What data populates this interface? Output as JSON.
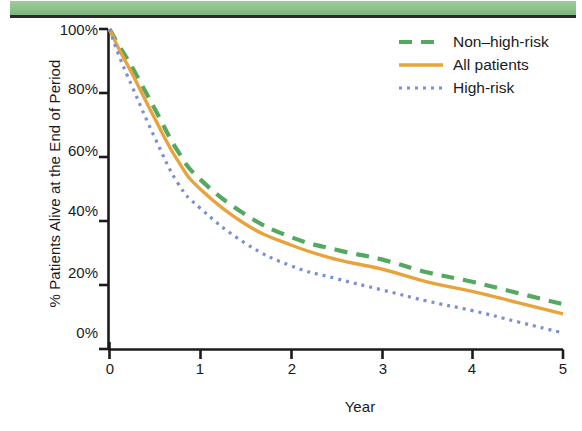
{
  "banner": {
    "name": "top-green-banner",
    "color": "#8cc08a",
    "rule_color": "#2a2a28"
  },
  "chart_data": {
    "type": "line",
    "title": "",
    "subtitle": "",
    "xlabel": "Year",
    "ylabel": "% Patients Alive at the End of Period",
    "xlim": [
      0,
      5
    ],
    "ylim": [
      0,
      100
    ],
    "grid": false,
    "legend_position": "top-right",
    "xticks": [
      0,
      1,
      2,
      3,
      4,
      5
    ],
    "xtick_labels": [
      "0",
      "1",
      "2",
      "3",
      "4",
      "5"
    ],
    "yticks": [
      0,
      20,
      40,
      60,
      80,
      100
    ],
    "ytick_labels": [
      "0%",
      "20%",
      "40%",
      "60%",
      "80%",
      "100%"
    ],
    "x": [
      0,
      0.1,
      0.25,
      0.5,
      0.75,
      1,
      1.5,
      2,
      2.5,
      3,
      3.5,
      4,
      4.5,
      5
    ],
    "series": [
      {
        "name": "Non–high-risk",
        "label": "Non–high-risk",
        "color": "#55a860",
        "style": "dashed",
        "values": [
          100,
          95,
          88,
          75,
          62,
          53,
          42,
          35,
          31,
          28,
          24,
          21,
          17.5,
          14
        ]
      },
      {
        "name": "All patients",
        "label": "All patients",
        "color": "#e9a33c",
        "style": "solid",
        "values": [
          100,
          94,
          86,
          72,
          59,
          50,
          39,
          32.5,
          28,
          25,
          21,
          18,
          14.5,
          11
        ]
      },
      {
        "name": "High-risk",
        "label": "High-risk",
        "color": "#7b8fd4",
        "style": "dotted",
        "values": [
          100,
          92,
          82,
          66,
          52,
          44,
          33,
          26,
          22,
          18.5,
          15,
          12,
          8.5,
          5
        ]
      }
    ]
  },
  "legend": {
    "entries": [
      {
        "label": "Non–high-risk",
        "color": "#55a860",
        "style": "dashed"
      },
      {
        "label": "All patients",
        "color": "#e9a33c",
        "style": "solid"
      },
      {
        "label": "High-risk",
        "color": "#7b8fd4",
        "style": "dotted"
      }
    ]
  },
  "axes": {
    "x_title": "Year",
    "y_title": "% Patients Alive at the End of Period"
  }
}
